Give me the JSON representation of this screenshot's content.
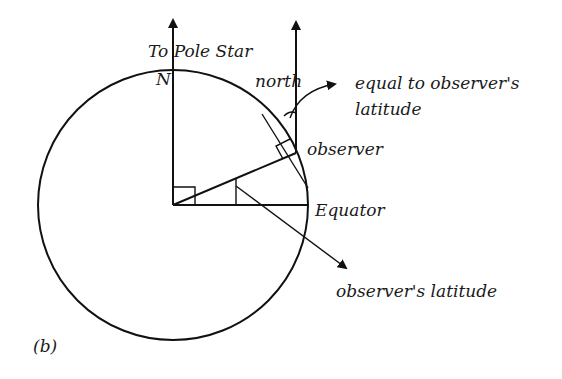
{
  "figure": {
    "panel_label": "(b)",
    "labels": {
      "pole_star": "To Pole Star",
      "north_pole": "N",
      "north": "north",
      "equal_line1": "equal to observer's",
      "equal_line2": "latitude",
      "observer": "observer",
      "equator": "Equator",
      "observers_latitude": "observer's latitude"
    },
    "colors": {
      "ink": "#111111",
      "background": "#ffffff"
    }
  }
}
